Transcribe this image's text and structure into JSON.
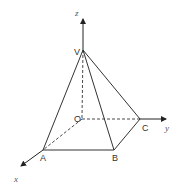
{
  "diagram": {
    "type": "3d-pyramid-coordinate",
    "colors": {
      "line": "#333333",
      "background": "#ffffff"
    },
    "axes": {
      "x": {
        "label": "x",
        "from": [
          82,
          119
        ],
        "to": [
          20,
          167
        ],
        "label_pos": [
          14,
          182
        ]
      },
      "y": {
        "label": "y",
        "from": [
          82,
          119
        ],
        "to": [
          167,
          119
        ],
        "label_pos": [
          166,
          131
        ]
      },
      "z": {
        "label": "z",
        "from": [
          82,
          119
        ],
        "to": [
          82,
          18
        ],
        "label_pos": [
          75,
          16
        ]
      }
    },
    "points": {
      "V": {
        "label": "V",
        "pos": [
          83,
          50
        ],
        "label_pos": [
          74,
          55
        ]
      },
      "O": {
        "label": "O",
        "pos": [
          82,
          119
        ],
        "label_pos": [
          74,
          122
        ]
      },
      "A": {
        "label": "A",
        "pos": [
          43,
          150
        ],
        "label_pos": [
          40,
          161
        ]
      },
      "B": {
        "label": "B",
        "pos": [
          114,
          150
        ],
        "label_pos": [
          112,
          161
        ]
      },
      "C": {
        "label": "C",
        "pos": [
          140,
          119
        ],
        "label_pos": [
          142,
          131
        ]
      }
    },
    "solid_edges": [
      [
        "V",
        "A"
      ],
      [
        "V",
        "B"
      ],
      [
        "V",
        "C"
      ],
      [
        "A",
        "B"
      ],
      [
        "B",
        "C"
      ]
    ],
    "dashed_edges": [
      [
        "V",
        "O"
      ],
      [
        "O",
        "A"
      ],
      [
        "O",
        "C"
      ]
    ]
  }
}
